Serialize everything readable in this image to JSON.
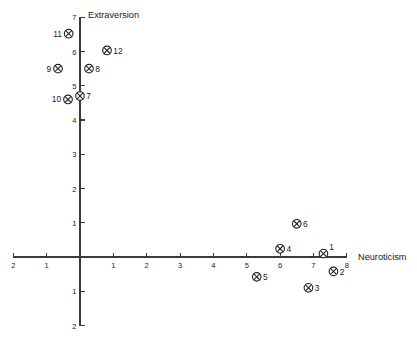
{
  "chart_data": {
    "type": "scatter",
    "title": "",
    "xlabel": "Neuroticism",
    "ylabel": "Extraversion",
    "xlim": [
      -2,
      8
    ],
    "ylim": [
      -2,
      7
    ],
    "xticks": [
      -2,
      -1,
      0,
      1,
      2,
      3,
      4,
      5,
      6,
      7,
      8
    ],
    "xtick_labels": [
      "2",
      "1",
      "",
      "1",
      "2",
      "3",
      "4",
      "5",
      "6",
      "7",
      "8"
    ],
    "yticks": [
      -2,
      -1,
      0,
      1,
      2,
      3,
      4,
      5,
      6,
      7
    ],
    "ytick_labels": [
      "2",
      "1",
      "",
      "1",
      "2",
      "3",
      "4",
      "5",
      "6",
      "7"
    ],
    "grid": false,
    "legend": "none",
    "marker": "circle-x",
    "points": [
      {
        "label": "1",
        "x": 7.3,
        "y": 0.1,
        "label_pos": "right-up"
      },
      {
        "label": "2",
        "x": 7.6,
        "y": -0.42,
        "label_pos": "right"
      },
      {
        "label": "3",
        "x": 6.85,
        "y": -0.9,
        "label_pos": "right"
      },
      {
        "label": "4",
        "x": 6.0,
        "y": 0.24,
        "label_pos": "right"
      },
      {
        "label": "5",
        "x": 5.3,
        "y": -0.58,
        "label_pos": "right"
      },
      {
        "label": "6",
        "x": 6.5,
        "y": 0.97,
        "label_pos": "right"
      },
      {
        "label": "7",
        "x": 0.0,
        "y": 4.7,
        "label_pos": "right"
      },
      {
        "label": "8",
        "x": 0.27,
        "y": 5.5,
        "label_pos": "right"
      },
      {
        "label": "9",
        "x": -0.66,
        "y": 5.5,
        "label_pos": "left"
      },
      {
        "label": "10",
        "x": -0.36,
        "y": 4.6,
        "label_pos": "left"
      },
      {
        "label": "11",
        "x": -0.34,
        "y": 6.52,
        "label_pos": "left"
      },
      {
        "label": "12",
        "x": 0.81,
        "y": 6.03,
        "label_pos": "right"
      }
    ]
  },
  "axes": {
    "x_axis_name": "neuroticism-axis",
    "y_axis_name": "extraversion-axis"
  }
}
